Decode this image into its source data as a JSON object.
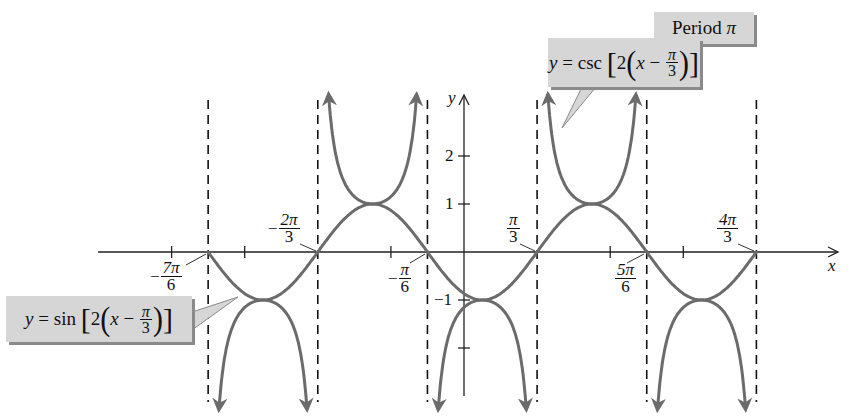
{
  "chart_data": {
    "type": "line",
    "title": "",
    "xlabel": "x",
    "ylabel": "y",
    "xlim_pi": [
      -1.45,
      1.45
    ],
    "ylim": [
      -2.9,
      3.2
    ],
    "grid": false,
    "y_ticks": [
      "2",
      "1",
      "-1"
    ],
    "y_tick_values": [
      2,
      1,
      -1,
      -2
    ],
    "x_tick_values_pi": [
      -1.3333,
      -1,
      -0.3333,
      0.6667,
      1
    ],
    "x_labels": [
      {
        "sign": "−",
        "num": "7π",
        "den": "6",
        "value_pi": -1.1667
      },
      {
        "sign": "−",
        "num": "2π",
        "den": "3",
        "value_pi": -0.6667
      },
      {
        "sign": "−",
        "num": "π",
        "den": "6",
        "value_pi": -0.1667
      },
      {
        "sign": "",
        "num": "π",
        "den": "3",
        "value_pi": 0.3333
      },
      {
        "sign": "",
        "num": "5π",
        "den": "6",
        "value_pi": 0.8333
      },
      {
        "sign": "",
        "num": "4π",
        "den": "3",
        "value_pi": 1.3333
      }
    ],
    "asymptotes_pi": [
      -1.1667,
      -0.6667,
      -0.1667,
      0.3333,
      0.8333,
      1.3333
    ],
    "series": [
      {
        "name": "y = sin[2(x − π/3)]",
        "style": "solid curve",
        "domain_pi": [
          -1.1667,
          1.3333
        ],
        "amplitude": 1,
        "period": "π",
        "phase_shift": "π/3"
      },
      {
        "name": "y = csc[2(x − π/3)]",
        "style": "solid curve with arrows",
        "branches": 5,
        "period": "π"
      }
    ],
    "annotations": [
      {
        "text": "Period π"
      },
      {
        "text": "y = csc[2(x − π/3)]"
      },
      {
        "text": "y = sin[2(x − π/3)]"
      }
    ],
    "colors": {
      "curve": "#6b6b6b",
      "axis": "#222222",
      "asymptote": "#111111",
      "callout_bg": "#d6d6d6",
      "callout_shadow": "#8a8a8a"
    }
  },
  "labels": {
    "period": {
      "word": "Period",
      "pi": "π"
    },
    "csc": {
      "y": "y",
      "eq": "=",
      "fn": "csc",
      "two": "2",
      "x": "x",
      "minus": "−",
      "num": "π",
      "den": "3"
    },
    "sin": {
      "y": "y",
      "eq": "=",
      "fn": "sin",
      "two": "2",
      "x": "x",
      "minus": "−",
      "num": "π",
      "den": "3"
    },
    "axis": {
      "x": "x",
      "y": "y",
      "yt2": "2",
      "yt1": "1",
      "ytm1": "−1"
    },
    "xl": {
      "m7pi6": {
        "sign": "−",
        "num": "7π",
        "den": "6"
      },
      "m2pi3": {
        "sign": "−",
        "num": "2π",
        "den": "3"
      },
      "mpi6": {
        "sign": "−",
        "num": "π",
        "den": "6"
      },
      "pi3": {
        "num": "π",
        "den": "3"
      },
      "5pi6": {
        "num": "5π",
        "den": "6"
      },
      "4pi3": {
        "num": "4π",
        "den": "3"
      }
    }
  }
}
